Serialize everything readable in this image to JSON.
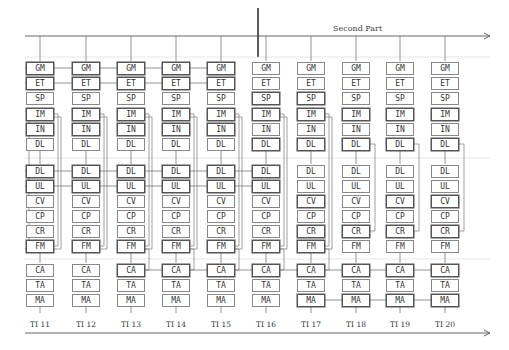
{
  "diagram": {
    "title": "Second Part",
    "rows": [
      "GM",
      "ET",
      "SP",
      "IM",
      "IN",
      "DL",
      "DL",
      "UL",
      "CV",
      "CP",
      "CR",
      "FM",
      "CA",
      "TA",
      "MA"
    ],
    "columns": [
      {
        "label": "TI 11",
        "rows": [
          "GM",
          "ET",
          "SP",
          "IM",
          "IN",
          "DL",
          "DL",
          "UL",
          "CV",
          "CP",
          "CR",
          "FM",
          "CA",
          "TA",
          "MA"
        ],
        "bold": [
          0,
          1,
          3,
          4,
          6,
          7,
          11
        ]
      },
      {
        "label": "TI 12",
        "rows": [
          "GM",
          "ET",
          "SP",
          "IM",
          "IN",
          "DL",
          "DL",
          "UL",
          "CV",
          "CP",
          "CR",
          "FM",
          "CA",
          "TA",
          "MA"
        ],
        "bold": [
          0,
          1,
          3,
          4,
          6,
          7,
          11
        ]
      },
      {
        "label": "TI 13",
        "rows": [
          "GM",
          "ET",
          "SP",
          "IM",
          "IN",
          "DL",
          "DL",
          "UL",
          "CV",
          "CP",
          "CR",
          "FM",
          "CA",
          "TA",
          "MA"
        ],
        "bold": [
          0,
          1,
          3,
          4,
          6,
          7,
          11,
          12
        ]
      },
      {
        "label": "TI 14",
        "rows": [
          "GM",
          "ET",
          "SP",
          "IM",
          "IN",
          "DL",
          "DL",
          "UL",
          "CV",
          "CP",
          "CR",
          "FM",
          "CA",
          "TA",
          "MA"
        ],
        "bold": [
          0,
          1,
          3,
          4,
          6,
          7,
          11,
          12
        ]
      },
      {
        "label": "TI 15",
        "rows": [
          "GM",
          "ET",
          "SP",
          "IM",
          "IN",
          "DL",
          "DL",
          "UL",
          "CV",
          "CP",
          "CR",
          "FM",
          "CA",
          "TA",
          "MA"
        ],
        "bold": [
          0,
          1,
          3,
          4,
          6,
          7,
          11,
          12
        ]
      },
      {
        "label": "TI 16",
        "rows": [
          "GM",
          "ET",
          "SP",
          "IM",
          "IN",
          "DL",
          "DL",
          "UL",
          "CV",
          "CP",
          "CR",
          "FM",
          "CA",
          "TA",
          "MA"
        ],
        "bold": [
          2,
          3,
          5,
          6,
          7,
          11,
          12
        ]
      },
      {
        "label": "TI 17",
        "rows": [
          "GM",
          "ET",
          "SP",
          "IM",
          "IN",
          "DL",
          "DL",
          "UL",
          "CV",
          "CP",
          "CR",
          "FM",
          "CA",
          "TA",
          "MA"
        ],
        "bold": [
          2,
          3,
          5,
          8,
          10,
          11,
          12,
          14
        ]
      },
      {
        "label": "TI 18",
        "rows": [
          "GM",
          "ET",
          "SP",
          "IM",
          "IN",
          "DL",
          "DL",
          "UL",
          "CV",
          "CP",
          "CR",
          "FM",
          "CA",
          "TA",
          "MA"
        ],
        "bold": [
          3,
          5,
          10,
          12,
          14
        ]
      },
      {
        "label": "TI 19",
        "rows": [
          "GM",
          "ET",
          "SP",
          "IM",
          "IN",
          "DL",
          "DL",
          "UL",
          "CV",
          "CP",
          "CR",
          "FM",
          "CA",
          "TA",
          "MA"
        ],
        "bold": [
          3,
          5,
          8,
          10,
          12,
          14
        ]
      },
      {
        "label": "TI 20",
        "rows": [
          "GM",
          "ET",
          "SP",
          "IM",
          "IN",
          "DL",
          "DL",
          "UL",
          "CV",
          "CP",
          "CR",
          "FM",
          "CA",
          "TA",
          "MA"
        ],
        "bold": [
          3,
          5,
          8,
          10,
          12,
          14
        ]
      }
    ]
  }
}
